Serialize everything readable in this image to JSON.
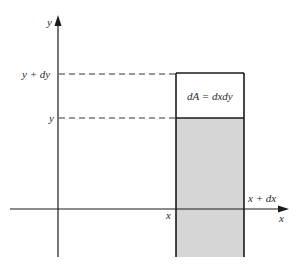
{
  "diagram": {
    "type": "area-element",
    "axes": {
      "y_label": "y",
      "x_label": "x"
    },
    "tick_labels": {
      "y_top": "y + dy",
      "y_bottom": "y",
      "x_left": "x",
      "x_right": "x + dx"
    },
    "element_label": "dA = dxdy",
    "colors": {
      "line": "#1a1a1a",
      "fill": "#d6d6d6",
      "background": "#ffffff"
    }
  }
}
